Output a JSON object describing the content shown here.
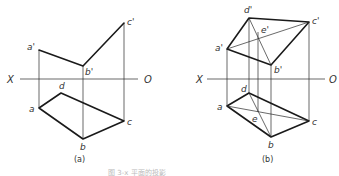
{
  "figure": {
    "caption_faint": "图 3-x 平面的投影",
    "panels": [
      {
        "id": "a",
        "caption": "(a)",
        "axis": {
          "left_label": "X",
          "right_label": "O",
          "x1": 20,
          "x2": 138,
          "y": 79
        },
        "points": {
          "a_prime": {
            "label": "a'",
            "x": 39,
            "y": 50
          },
          "b_prime": {
            "label": "b'",
            "x": 83,
            "y": 66
          },
          "c_prime": {
            "label": "c'",
            "x": 124,
            "y": 23
          },
          "a": {
            "label": "a",
            "x": 39,
            "y": 108
          },
          "b": {
            "label": "b",
            "x": 83,
            "y": 139
          },
          "c": {
            "label": "c",
            "x": 124,
            "y": 121
          },
          "d": {
            "label": "d",
            "x": 61,
            "y": 93
          }
        }
      },
      {
        "id": "b",
        "caption": "(b)",
        "axis": {
          "left_label": "X",
          "right_label": "O",
          "x1": 207,
          "x2": 325,
          "y": 79
        },
        "points": {
          "a_prime": {
            "label": "a'",
            "x": 227,
            "y": 49
          },
          "b_prime": {
            "label": "b'",
            "x": 271,
            "y": 65
          },
          "c_prime": {
            "label": "c'",
            "x": 309,
            "y": 22
          },
          "d_prime": {
            "label": "d'",
            "x": 249,
            "y": 18
          },
          "e_prime": {
            "label": "e'",
            "x": 258,
            "y": 32
          },
          "a": {
            "label": "a",
            "x": 227,
            "y": 106
          },
          "b": {
            "label": "b",
            "x": 271,
            "y": 137
          },
          "c": {
            "label": "c",
            "x": 309,
            "y": 121
          },
          "d": {
            "label": "d",
            "x": 249,
            "y": 93
          },
          "e": {
            "label": "e",
            "x": 258,
            "y": 112
          }
        }
      }
    ]
  }
}
